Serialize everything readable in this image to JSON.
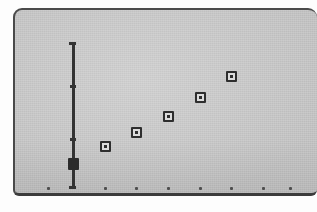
{
  "figure": {
    "panel_label": "plot panel",
    "background_color": "#c9c9c9",
    "ink_color": "#2e2e2e",
    "frame_color": "#444444"
  },
  "chart_data": {
    "type": "scatter",
    "title": "",
    "subtitle": "",
    "xlabel": "",
    "ylabel": "",
    "grid": false,
    "legend": "none",
    "xlim": [
      0,
      8
    ],
    "ylim": [
      0,
      8
    ],
    "x_tick_labels": [
      "",
      "",
      "",
      "",
      "",
      "",
      "",
      ""
    ],
    "y_tick_labels": [
      "",
      "",
      ""
    ],
    "series": [
      {
        "name": "data",
        "marker": "open-square",
        "x": [
          2,
          3,
          4,
          5,
          6
        ],
        "y": [
          2.15,
          2.8,
          3.55,
          4.45,
          5.45
        ]
      },
      {
        "name": "origin-marker",
        "marker": "filled-square",
        "x": [
          1
        ],
        "y": [
          1.3
        ]
      }
    ],
    "y_axis": {
      "top": 7.05,
      "bottom": 0.15,
      "ticks": [
        1.3,
        2.45,
        4.95
      ]
    },
    "x_axis": {
      "dot_positions": [
        0.2,
        1,
        2,
        3,
        4,
        5,
        6,
        7,
        7.85
      ],
      "dot_y": 0.16
    }
  }
}
